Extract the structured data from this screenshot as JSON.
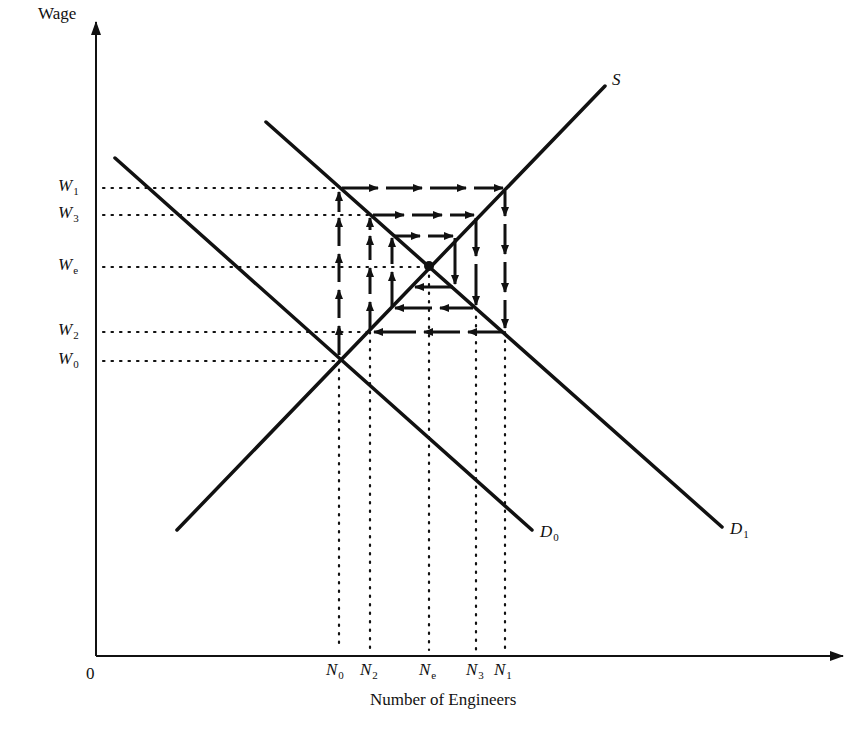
{
  "figure": {
    "type": "cobweb labor market diagram",
    "y_axis_label": "Wage",
    "x_axis_label": "Number of Engineers",
    "origin_label": "0",
    "curves": {
      "supply": {
        "label": "S"
      },
      "demand_initial": {
        "label": "D",
        "subscript": "0"
      },
      "demand_new": {
        "label": "D",
        "subscript": "1"
      }
    },
    "wage_levels": [
      {
        "label": "W",
        "subscript": "1"
      },
      {
        "label": "W",
        "subscript": "3"
      },
      {
        "label": "W",
        "subscript": "e"
      },
      {
        "label": "W",
        "subscript": "2"
      },
      {
        "label": "W",
        "subscript": "0"
      }
    ],
    "quantity_levels": [
      {
        "label": "N",
        "subscript": "0"
      },
      {
        "label": "N",
        "subscript": "2"
      },
      {
        "label": "N",
        "subscript": "e"
      },
      {
        "label": "N",
        "subscript": "3"
      },
      {
        "label": "N",
        "subscript": "1"
      }
    ],
    "colors": {
      "ink": "#111111",
      "background": "#ffffff"
    }
  }
}
